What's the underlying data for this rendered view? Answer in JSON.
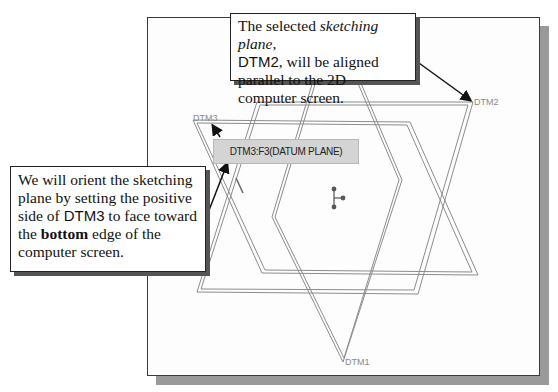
{
  "viewport": {
    "plane_labels": {
      "dtm2": "DTM2",
      "dtm3": "DTM3",
      "dtm1": "DTM1"
    },
    "tooltip": "DTM3:F3(DATUM PLANE)",
    "colors": {
      "plane_edge": "#8c8c8c",
      "frame": "#3a3a3a",
      "shadow": "#9a9a9a",
      "tooltip_bg": "#d4d4d4"
    }
  },
  "callouts": {
    "top": {
      "part1": "The selected ",
      "italic": "sketching plane",
      "part2": ",",
      "sans": "DTM2",
      "part3": ", will be aligned parallel to the 2D computer screen."
    },
    "left": {
      "part1": "We will orient the sketching plane by setting the positive side of ",
      "sans": "DTM3",
      "part2": " to face toward the ",
      "bold": "bottom",
      "part3": " edge of the computer screen."
    }
  }
}
